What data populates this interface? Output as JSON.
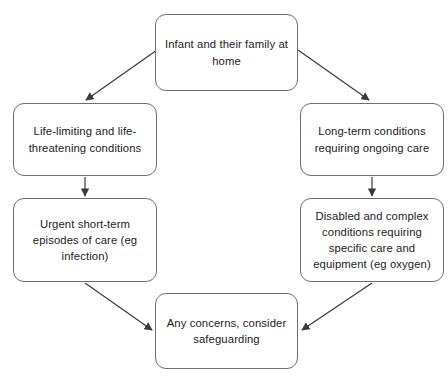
{
  "diagram": {
    "type": "flowchart",
    "canvas": {
      "width": 448,
      "height": 379
    },
    "style": {
      "node_border_color": "#6e6e6e",
      "node_fill_color": "#ffffff",
      "arrow_color": "#3a3a3a",
      "text_color": "#1c1c1c",
      "background_color": "#ffffff"
    },
    "nodes": [
      {
        "id": "top",
        "label": "Infant and their family at\nhome",
        "shape": "rounded-rectangle"
      },
      {
        "id": "left-1",
        "label": "Life-limiting and life-\nthreatening conditions",
        "shape": "rounded-rectangle"
      },
      {
        "id": "left-2",
        "label": "Urgent short-term\nepisodes of care (eg\ninfection)",
        "shape": "rounded-rectangle"
      },
      {
        "id": "right-1",
        "label": "Long-term conditions\nrequiring ongoing care",
        "shape": "rounded-rectangle"
      },
      {
        "id": "right-2",
        "label": "Disabled and complex\nconditions requiring\nspecific care and\nequipment (eg oxygen)",
        "shape": "rounded-rectangle"
      },
      {
        "id": "bottom",
        "label": "Any concerns, consider\nsafeguarding",
        "shape": "rounded-rectangle"
      }
    ],
    "edges": [
      {
        "id": "top-to-left-1",
        "from": "top",
        "to": "left-1",
        "style": "diagonal-arrow"
      },
      {
        "id": "top-to-right-1",
        "from": "top",
        "to": "right-1",
        "style": "diagonal-arrow"
      },
      {
        "id": "left-1-to-left-2",
        "from": "left-1",
        "to": "left-2",
        "style": "vertical-arrow"
      },
      {
        "id": "right-1-to-right-2",
        "from": "right-1",
        "to": "right-2",
        "style": "vertical-arrow"
      },
      {
        "id": "left-2-to-bottom",
        "from": "left-2",
        "to": "bottom",
        "style": "diagonal-arrow"
      },
      {
        "id": "right-2-to-bottom",
        "from": "right-2",
        "to": "bottom",
        "style": "diagonal-arrow"
      }
    ]
  }
}
